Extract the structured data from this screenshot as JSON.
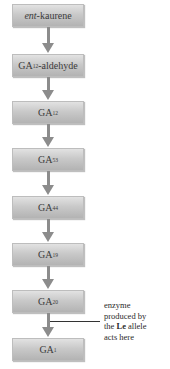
{
  "diagram": {
    "type": "biosynthetic-pathway",
    "steps": [
      {
        "prefix_italic": "ent",
        "label": "-kaurene",
        "sub": ""
      },
      {
        "label": "GA",
        "sub": "12",
        "suffix": "-aldehyde"
      },
      {
        "label": "GA",
        "sub": "12"
      },
      {
        "label": "GA",
        "sub": "53"
      },
      {
        "label": "GA",
        "sub": "44"
      },
      {
        "label": "GA",
        "sub": "19"
      },
      {
        "label": "GA",
        "sub": "20"
      },
      {
        "label": "GA",
        "sub": "1"
      }
    ],
    "annotation": {
      "line1": "enzyme",
      "line2": "produced by",
      "line3_pre": "the ",
      "line3_bold": "Le",
      "line3_post": " allele",
      "line4": "acts here",
      "points_to_step": "GA20 → GA1"
    },
    "colors": {
      "box_top": "#e2e2e2",
      "box_bottom": "#b3b3b3",
      "arrow": "#8c8c8c",
      "text": "#3a3a3a"
    }
  }
}
